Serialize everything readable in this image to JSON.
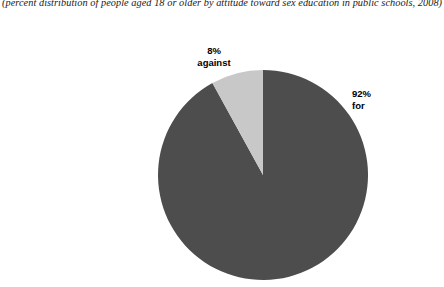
{
  "caption": "(percent distribution of people aged 18 or older by attitude toward sex education in public schools, 2008)",
  "labels": {
    "against": {
      "percent": "8%",
      "word": "against"
    },
    "for": {
      "percent": "92%",
      "word": "for"
    }
  },
  "colors": {
    "background": "#ffffff",
    "slice_for": "#4d4d4d",
    "slice_against": "#c8c8c8",
    "text": "#000000"
  },
  "chart_data": {
    "type": "pie",
    "title": "",
    "subtitle": "(percent distribution of people aged 18 or older by attitude toward sex education in public schools, 2008)",
    "xlabel": "",
    "ylabel": "",
    "categories": [
      "for",
      "against"
    ],
    "values": [
      92,
      8
    ],
    "units": "percent",
    "slices": [
      {
        "label": "for",
        "value": 92,
        "display": "92%",
        "color": "#4d4d4d",
        "start_angle_deg": 0,
        "end_angle_deg": 331.2
      },
      {
        "label": "against",
        "value": 8,
        "display": "8%",
        "color": "#c8c8c8",
        "start_angle_deg": 331.2,
        "end_angle_deg": 360
      }
    ],
    "start_angle": "12 o'clock",
    "direction": "counterclockwise",
    "legend": "none",
    "grid": false,
    "annotations": [
      "8% against",
      "92% for"
    ]
  }
}
